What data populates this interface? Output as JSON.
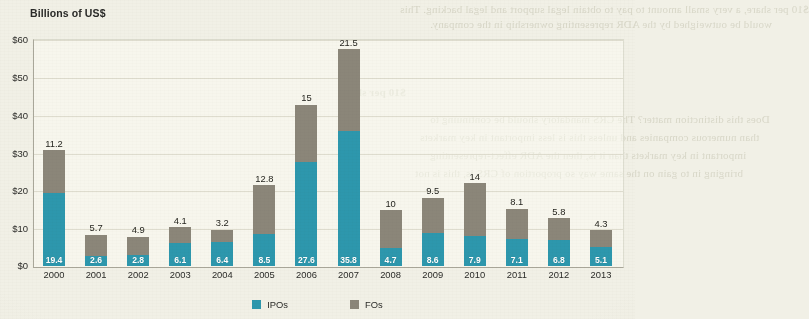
{
  "chart_data": {
    "type": "bar",
    "subtype": "stacked-bar",
    "title": "Billions of US$",
    "xlabel": "",
    "ylabel": "Billions of US$",
    "ylim": [
      0,
      60
    ],
    "ytick_labels": [
      "$0",
      "$10",
      "$20",
      "$30",
      "$40",
      "$50",
      "$60"
    ],
    "ytick_values": [
      0,
      10,
      20,
      30,
      40,
      50,
      60
    ],
    "grid": true,
    "legend_position": "bottom-center",
    "categories": [
      "2000",
      "2001",
      "2002",
      "2003",
      "2004",
      "2005",
      "2006",
      "2007",
      "2008",
      "2009",
      "2010",
      "2011",
      "2012",
      "2013"
    ],
    "series": [
      {
        "name": "IPOs",
        "color": "#2d97ad",
        "values": [
          19.4,
          2.6,
          2.8,
          6.1,
          6.4,
          8.5,
          27.6,
          35.8,
          4.7,
          8.6,
          7.9,
          7.1,
          6.8,
          5.1
        ]
      },
      {
        "name": "FOs",
        "color": "#8b8679",
        "values": [
          11.2,
          5.7,
          4.9,
          4.1,
          3.2,
          12.8,
          15,
          21.5,
          10,
          9.5,
          14,
          8.1,
          5.8,
          4.3
        ]
      }
    ],
    "totals": [
      30.6,
      8.3,
      7.7,
      10.2,
      9.6,
      21.3,
      42.6,
      57.3,
      14.7,
      18.1,
      21.9,
      15.2,
      12.6,
      9.4
    ]
  },
  "legend": {
    "items": [
      {
        "label": "IPOs",
        "color": "#2d97ad"
      },
      {
        "label": "FOs",
        "color": "#8b8679"
      }
    ]
  },
  "page_bleed": {
    "lines": [
      {
        "text": "$10 per share, a very small amount to pay to obtain legal support and legal backing. This",
        "x": 60,
        "y": 4,
        "size": 11
      },
      {
        "text": "would be outweighed by the ADR representing ownership in the company.",
        "x": 92,
        "y": 18,
        "size": 11
      },
      {
        "text": "$10 per share",
        "x": 250,
        "y": 82,
        "size": 11
      },
      {
        "text": "Does this distinction matter? The CRS mandatory should be continuing to",
        "x": 96,
        "y": 112,
        "size": 11
      },
      {
        "text": "than numerous companies and unless this is less important in key markets",
        "x": 92,
        "y": 128,
        "size": 11
      },
      {
        "text": "important in key markets than it is, then the ADR effect-representing",
        "x": 100,
        "y": 144,
        "size": 11
      },
      {
        "text": "bringing in to gain on the same way so proportion of CRS is, this is not",
        "x": 98,
        "y": 160,
        "size": 11
      }
    ]
  }
}
